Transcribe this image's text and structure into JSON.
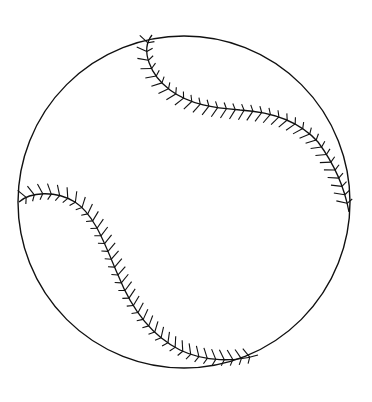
{
  "image": {
    "subject": "baseball line drawing",
    "background": "#ffffff",
    "stroke": "#111111",
    "ball": {
      "cx": 184,
      "cy": 202,
      "r": 166
    }
  }
}
